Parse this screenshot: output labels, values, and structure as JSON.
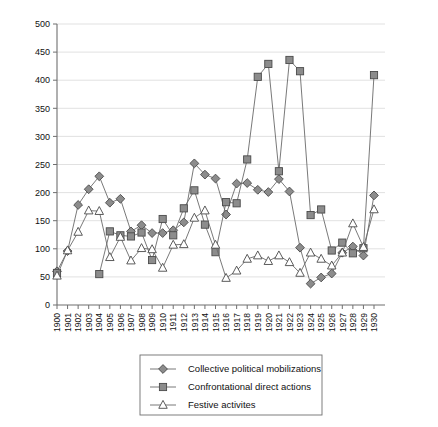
{
  "chart_data": {
    "type": "line",
    "title": "",
    "subtitle": "",
    "xlabel": "",
    "ylabel": "",
    "ylim": [
      0,
      500
    ],
    "ytick_step": 50,
    "yticks": [
      0,
      50,
      100,
      150,
      200,
      250,
      300,
      350,
      400,
      450,
      500
    ],
    "ytick_labels": [
      "0",
      "50",
      "100",
      "150",
      "200",
      "250",
      "300",
      "350",
      "400",
      "450",
      "500"
    ],
    "grid": true,
    "grid_axis": "y",
    "legend_position": "bottom-center",
    "x": [
      1900,
      1901,
      1902,
      1903,
      1904,
      1905,
      1906,
      1907,
      1908,
      1909,
      1910,
      1911,
      1912,
      1913,
      1914,
      1915,
      1916,
      1917,
      1918,
      1919,
      1920,
      1921,
      1922,
      1923,
      1924,
      1925,
      1926,
      1927,
      1928,
      1929,
      1930
    ],
    "categories": [
      "1900",
      "1901",
      "1902",
      "1903",
      "1904",
      "1905",
      "1906",
      "1907",
      "1908",
      "1909",
      "1910",
      "1911",
      "1912",
      "1913",
      "1914",
      "1915",
      "1916",
      "1917",
      "1918",
      "1919",
      "1920",
      "1921",
      "1922",
      "1923",
      "1924",
      "1925",
      "1926",
      "1927",
      "1928",
      "1929",
      "1930"
    ],
    "series": [
      {
        "name": "Collective political mobilizations",
        "marker": "diamond",
        "marker_fill": "#8c8c8c",
        "line_color": "#6a6a6a",
        "values": [
          60,
          96,
          178,
          206,
          229,
          182,
          189,
          131,
          142,
          128,
          128,
          133,
          147,
          252,
          232,
          225,
          161,
          216,
          217,
          205,
          201,
          224,
          202,
          102,
          38,
          49,
          56,
          93,
          104,
          88,
          195
        ]
      },
      {
        "name": "Confrontational direct actions",
        "marker": "square",
        "marker_fill": "#8c8c8c",
        "line_color": "#6a6a6a",
        "values": [
          57,
          null,
          null,
          null,
          55,
          131,
          124,
          122,
          129,
          80,
          153,
          124,
          172,
          204,
          143,
          94,
          183,
          181,
          259,
          406,
          429,
          238,
          436,
          416,
          160,
          170,
          97,
          111,
          92,
          101,
          409
        ]
      },
      {
        "name": "Festive activites",
        "marker": "triangle",
        "marker_fill": "#ffffff",
        "line_color": "#6a6a6a",
        "values": [
          52,
          97,
          130,
          168,
          167,
          85,
          121,
          79,
          101,
          99,
          66,
          107,
          108,
          155,
          168,
          107,
          48,
          61,
          82,
          88,
          78,
          88,
          76,
          57,
          93,
          82,
          70,
          93,
          145,
          103,
          170
        ]
      }
    ]
  },
  "legend": {
    "items": [
      {
        "label": "Collective political mobilizations",
        "marker": "diamond"
      },
      {
        "label": "Confrontational direct actions",
        "marker": "square"
      },
      {
        "label": "Festive activites",
        "marker": "triangle"
      }
    ]
  },
  "colors": {
    "marker_fill": "#8c8c8c",
    "marker_stroke": "#4a4a4a",
    "line": "#6a6a6a",
    "grid": "#d9d9d9",
    "axis": "#6f6f6f",
    "background": "#ffffff"
  }
}
